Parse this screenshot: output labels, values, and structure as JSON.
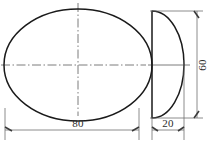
{
  "drawing": {
    "title": "Two-view orthographic drawing",
    "views": [
      {
        "name": "front-view",
        "shape": "ellipse",
        "center": {
          "x": 78,
          "y": 65
        },
        "radius_x": 74,
        "radius_y": 56
      },
      {
        "name": "side-view",
        "shape": "half-ellipse",
        "flat_edge_x": 152,
        "top_y": 11,
        "bottom_y": 118,
        "apex_x": 184,
        "center_y": 65
      }
    ],
    "dimensions": [
      {
        "name": "width-dimension",
        "value": "80",
        "orientation": "horizontal",
        "applies_to": "front-view",
        "label_x": 78,
        "label_y": 134
      },
      {
        "name": "depth-dimension",
        "value": "20",
        "orientation": "horizontal",
        "applies_to": "side-view",
        "label_x": 168,
        "label_y": 134
      },
      {
        "name": "height-dimension",
        "value": "60",
        "orientation": "vertical",
        "applies_to": "side-view",
        "label_x": 205,
        "label_y": 65
      }
    ],
    "colors": {
      "outline": "#1a1a1a",
      "centerline": "#5c5c5c",
      "dimension": "#6e6e6e",
      "text": "#2b2b2b",
      "background": "#ffffff"
    }
  }
}
